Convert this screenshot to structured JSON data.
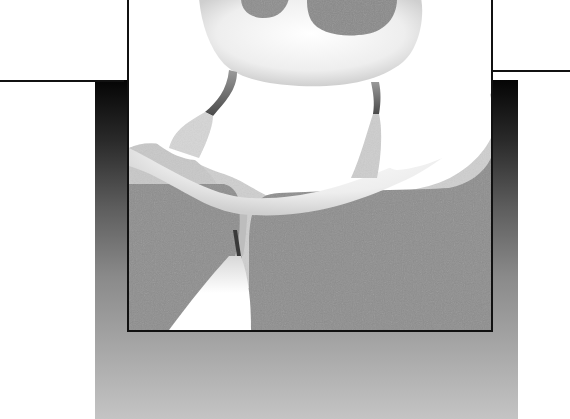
{
  "figure": {
    "kind": "histological cross-section illustration",
    "text": [],
    "palette": {
      "background": "#ffffff",
      "outline": "#111111",
      "tissue_dark": "#8e8e8e",
      "tissue_mid": "#c8c8c8",
      "tissue_light": "#f4f4f4",
      "band_top": "#050505",
      "band_bottom": "#c4c4c4"
    },
    "regions": [
      {
        "name": "left-ledge",
        "shade": "white"
      },
      {
        "name": "right-ledge",
        "shade": "white"
      },
      {
        "name": "gradient-backdrop-band",
        "shade": "black-to-gray gradient"
      },
      {
        "name": "framed-section",
        "shade": "gray with white lumens"
      }
    ]
  }
}
